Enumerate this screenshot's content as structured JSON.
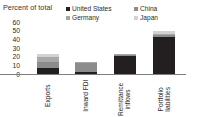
{
  "chart_data": {
    "type": "bar",
    "subtype": "stacked-column",
    "title": "Percent of total",
    "xlabel": "",
    "ylabel": "",
    "ylim": [
      0,
      60
    ],
    "yticks": [
      60,
      50,
      40,
      30,
      20,
      10,
      0
    ],
    "ytick_labels": [
      "60",
      "50",
      "40",
      "30",
      "20",
      "10",
      "0"
    ],
    "grid": false,
    "legend_position": "top-right",
    "categories": [
      "Exports",
      "Inward FDI",
      "Remittance inflows",
      "Portfolio liabilities"
    ],
    "series": [
      {
        "name": "United States",
        "color": "#231f20",
        "values": [
          7,
          2,
          21,
          43
        ]
      },
      {
        "name": "China",
        "color": "#8c8c8c",
        "values": [
          7,
          11,
          1.5,
          1.5
        ]
      },
      {
        "name": "Germany",
        "color": "#a8a8a8",
        "values": [
          6,
          0.5,
          0.5,
          2
        ]
      },
      {
        "name": "Japan",
        "color": "#d2d2d2",
        "values": [
          3,
          0.5,
          0.5,
          3.5
        ]
      }
    ],
    "totals": [
      23,
      14,
      23.5,
      50
    ]
  },
  "legend": {
    "entries": [
      {
        "label": "United States",
        "color": "#231f20"
      },
      {
        "label": "China",
        "color": "#8c8c8c"
      },
      {
        "label": "Germany",
        "color": "#a8a8a8"
      },
      {
        "label": "Japan",
        "color": "#d2d2d2"
      }
    ]
  },
  "axis": {
    "baseline_color": "#7d7d7d"
  }
}
